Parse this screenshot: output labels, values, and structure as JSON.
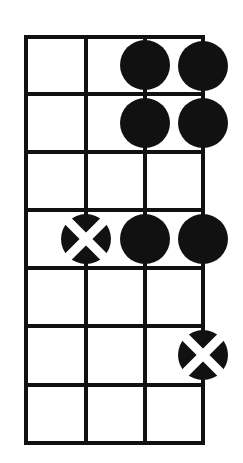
{
  "diagram": {
    "kind": "fretboard-chord-diagram",
    "title": "",
    "instrument_strings": 4,
    "frets_shown": 7,
    "colors": {
      "ink": "#111111",
      "background": "#ffffff",
      "marker_fill": "#111111",
      "marker_cross": "#ffffff"
    },
    "geometry": {
      "left": 26,
      "right": 203,
      "top": 37,
      "bottom": 443,
      "string_x": [
        26,
        86,
        145,
        203
      ],
      "fret_y": [
        37,
        94,
        152,
        210,
        268,
        326,
        385,
        443
      ],
      "grid_line_width": 4,
      "marker_radius": 25,
      "cross_stroke": 9
    },
    "strings": [
      {
        "index": 1,
        "label": "string-1",
        "x": 26
      },
      {
        "index": 2,
        "label": "string-2",
        "x": 86
      },
      {
        "index": 3,
        "label": "string-3",
        "x": 145
      },
      {
        "index": 4,
        "label": "string-4",
        "x": 203
      }
    ],
    "frets": [
      {
        "index": 0,
        "label": "nut",
        "y": 37
      },
      {
        "index": 1,
        "label": "fret-1",
        "y": 94
      },
      {
        "index": 2,
        "label": "fret-2",
        "y": 152
      },
      {
        "index": 3,
        "label": "fret-3",
        "y": 210
      },
      {
        "index": 4,
        "label": "fret-4",
        "y": 268
      },
      {
        "index": 5,
        "label": "fret-5",
        "y": 326
      },
      {
        "index": 6,
        "label": "fret-6",
        "y": 385
      },
      {
        "index": 7,
        "label": "fret-7",
        "y": 443
      }
    ],
    "markers": [
      {
        "id": "m1",
        "type": "dot",
        "string": 3,
        "fret_space": 1,
        "cx": 145,
        "cy": 65,
        "label": "note-marker"
      },
      {
        "id": "m2",
        "type": "dot",
        "string": 4,
        "fret_space": 1,
        "cx": 203,
        "cy": 66,
        "label": "note-marker"
      },
      {
        "id": "m3",
        "type": "dot",
        "string": 3,
        "fret_space": 2,
        "cx": 145,
        "cy": 123,
        "label": "note-marker"
      },
      {
        "id": "m4",
        "type": "dot",
        "string": 4,
        "fret_space": 2,
        "cx": 203,
        "cy": 123,
        "label": "note-marker"
      },
      {
        "id": "m5",
        "type": "cross",
        "string": 2,
        "fret_space": 4,
        "cx": 86,
        "cy": 239,
        "label": "root-marker"
      },
      {
        "id": "m6",
        "type": "dot",
        "string": 3,
        "fret_space": 4,
        "cx": 145,
        "cy": 239,
        "label": "note-marker"
      },
      {
        "id": "m7",
        "type": "dot",
        "string": 4,
        "fret_space": 4,
        "cx": 203,
        "cy": 239,
        "label": "note-marker"
      },
      {
        "id": "m8",
        "type": "cross",
        "string": 4,
        "fret_space": 6,
        "cx": 203,
        "cy": 355,
        "label": "root-marker"
      }
    ]
  },
  "chart_data": {
    "type": "scatter",
    "xlabel": "String",
    "ylabel": "Fret",
    "xlim": [
      1,
      4
    ],
    "ylim": [
      1,
      7
    ],
    "grid": true,
    "legend_position": "none",
    "categories": [
      "string-1",
      "string-2",
      "string-3",
      "string-4"
    ],
    "tick_labels_y": [
      "fret-1",
      "fret-2",
      "fret-3",
      "fret-4",
      "fret-5",
      "fret-6",
      "fret-7"
    ],
    "series": [
      {
        "name": "filled-dot",
        "marker": "filled-circle",
        "points": [
          {
            "x": 3,
            "y": 1
          },
          {
            "x": 4,
            "y": 1
          },
          {
            "x": 3,
            "y": 2
          },
          {
            "x": 4,
            "y": 2
          },
          {
            "x": 3,
            "y": 4
          },
          {
            "x": 4,
            "y": 4
          }
        ]
      },
      {
        "name": "cross-circle",
        "marker": "circle-with-x",
        "points": [
          {
            "x": 2,
            "y": 4
          },
          {
            "x": 4,
            "y": 6
          }
        ]
      }
    ],
    "annotations": []
  }
}
